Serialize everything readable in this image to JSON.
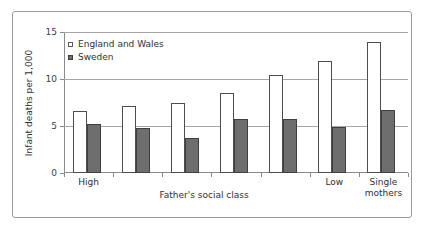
{
  "chart_data": {
    "type": "bar",
    "title": "",
    "xlabel": "Father's social class",
    "ylabel": "Infant deaths per 1,000",
    "ylim": [
      0,
      15
    ],
    "yticks": [
      0,
      5,
      10,
      15
    ],
    "ytick_labels": [
      "0",
      "5",
      "10",
      "15"
    ],
    "grid": true,
    "legend_position": "top-left",
    "categories": [
      "I",
      "II",
      "IIIN",
      "IIIM",
      "IV",
      "V",
      "Single mothers"
    ],
    "visible_category_labels": [
      {
        "index": 0,
        "label": "High"
      },
      {
        "index": 5,
        "label": "Low"
      },
      {
        "index": 6,
        "label": "Single\nmothers",
        "line1": "Single",
        "line2": "mothers"
      }
    ],
    "series": [
      {
        "name": "England and Wales",
        "color": "#ffffff",
        "edge_color": "#4d4d4d",
        "values": [
          6.6,
          7.1,
          7.4,
          8.5,
          10.4,
          11.9,
          13.9
        ]
      },
      {
        "name": "Sweden",
        "color": "#6e6e6e",
        "edge_color": "#3f3f3f",
        "values": [
          5.2,
          4.8,
          3.7,
          5.7,
          5.7,
          4.9,
          6.7
        ]
      }
    ]
  },
  "legend": {
    "entries": [
      {
        "label": "England and Wales"
      },
      {
        "label": "Sweden"
      }
    ]
  },
  "axis": {
    "y_title": "Infant deaths per 1,000",
    "x_title": "Father's social class",
    "y_tick_0": "0",
    "y_tick_1": "5",
    "y_tick_2": "10",
    "y_tick_3": "15"
  },
  "category_labels": {
    "first": "High",
    "sixth": "Low",
    "seventh_line1": "Single",
    "seventh_line2": "mothers"
  },
  "colors": {
    "series_england_wales": "#ffffff",
    "series_sweden": "#6e6e6e",
    "gridline": "#a6a6a6",
    "axis": "#8a8a8a",
    "frame_border": "#9a9a9a",
    "text": "#303030",
    "background": "#ffffff"
  }
}
